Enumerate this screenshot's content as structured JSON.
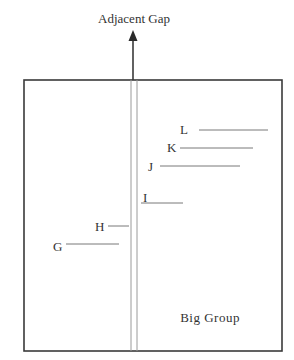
{
  "diagram": {
    "top_label": "Adjacent Gap",
    "group_label": "Big Group",
    "colors": {
      "stroke": "#3a3a3a",
      "thin_stroke": "#9a9a9a",
      "text": "#333333",
      "background": "#ffffff"
    },
    "box": {
      "x": 24,
      "y": 80,
      "width": 258,
      "height": 271
    },
    "arrow": {
      "x": 133,
      "y_start": 80,
      "y_tip": 30
    },
    "divider_lines": [
      {
        "x": 131
      },
      {
        "x": 137
      }
    ],
    "markers": [
      {
        "label": "L",
        "label_x": 180,
        "label_y": 134,
        "line_x1": 199,
        "line_x2": 268,
        "line_y": 130
      },
      {
        "label": "K",
        "label_x": 167,
        "label_y": 152,
        "line_x1": 180,
        "line_x2": 253,
        "line_y": 148
      },
      {
        "label": "J",
        "label_x": 148,
        "label_y": 171,
        "line_x1": 160,
        "line_x2": 240,
        "line_y": 166
      },
      {
        "label": "I",
        "label_x": 143,
        "label_y": 202,
        "line_x1": 141,
        "line_x2": 183,
        "line_y": 203
      },
      {
        "label": "H",
        "label_x": 95,
        "label_y": 231,
        "line_x1": 108,
        "line_x2": 129,
        "line_y": 226
      },
      {
        "label": "G",
        "label_x": 53,
        "label_y": 251,
        "line_x1": 66,
        "line_x2": 119,
        "line_y": 244
      }
    ]
  }
}
